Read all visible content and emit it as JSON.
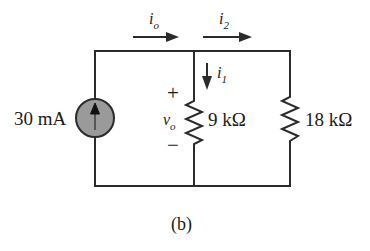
{
  "figure": {
    "caption": "(b)",
    "type": "electrical-circuit-schematic"
  },
  "source": {
    "label": "30 mA",
    "kind": "current-source",
    "direction": "up",
    "fill_color": "#9a9a9a"
  },
  "currents": [
    {
      "name": "i-o",
      "base": "i",
      "sub": "o",
      "direction": "right",
      "position": "top-left-branch"
    },
    {
      "name": "i-2",
      "base": "i",
      "sub": "2",
      "direction": "right",
      "position": "top-right-branch"
    },
    {
      "name": "i-1",
      "base": "i",
      "sub": "1",
      "direction": "down",
      "position": "middle-branch"
    }
  ],
  "voltage": {
    "base": "v",
    "sub": "o",
    "plus": "+",
    "minus": "−"
  },
  "resistors": [
    {
      "name": "r-9k",
      "label": "9 kΩ",
      "value": 9,
      "unit": "kΩ",
      "branch": "middle"
    },
    {
      "name": "r-18k",
      "label": "18 kΩ",
      "value": 18,
      "unit": "kΩ",
      "branch": "right"
    }
  ],
  "colors": {
    "wire": "#2b2b2b",
    "text": "#1a1a1a",
    "source_fill": "#9a9a9a",
    "background": "#ffffff"
  }
}
